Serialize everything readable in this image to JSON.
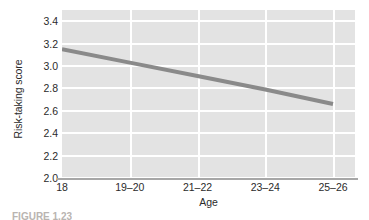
{
  "chart_data": {
    "type": "line",
    "title": "",
    "xlabel": "Age",
    "ylabel": "Risk-taking score",
    "categories": [
      "18",
      "19–20",
      "21–22",
      "23–24",
      "25–26"
    ],
    "series": [
      {
        "name": "Risk-taking score",
        "values": [
          3.15,
          3.03,
          2.91,
          2.79,
          2.66
        ],
        "color": "#8a8a8a"
      }
    ],
    "ylim": [
      2.0,
      3.5
    ],
    "yticks": [
      "3.4",
      "3.2",
      "3.0",
      "2.8",
      "2.6",
      "2.4",
      "2.2",
      "2.0"
    ],
    "ytick_values": [
      3.4,
      3.2,
      3.0,
      2.8,
      2.6,
      2.4,
      2.2,
      2.0
    ],
    "grid": "on",
    "grid_color": "#ffffff",
    "plot_background": "#e3e3e3",
    "legend": "none",
    "legend_position": "none"
  },
  "caption": {
    "text": "FIGURE 1.23"
  }
}
